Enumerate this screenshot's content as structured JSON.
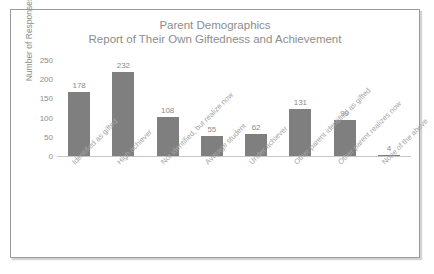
{
  "chart_data": {
    "type": "bar",
    "title": "Parent Demographics",
    "subtitle": "Report of Their Own Giftedness and Achievement",
    "xlabel": "",
    "ylabel": "Number of Responses",
    "ylim": [
      0,
      250
    ],
    "yticks": [
      250,
      200,
      150,
      100,
      50,
      0
    ],
    "grid": false,
    "legend": null,
    "bar_color": "#7f7f7f",
    "categories": [
      "Identified as gifted",
      "High achiever",
      "Not identified, but realize now",
      "Average student",
      "Under achiever",
      "Other parent identified as gifted",
      "Other parent realizes now",
      "None of the above"
    ],
    "values": [
      178,
      232,
      108,
      55,
      62,
      131,
      99,
      4
    ],
    "data_labels": [
      "178",
      "232",
      "108",
      "55",
      "62",
      "131",
      "99",
      "4"
    ]
  }
}
